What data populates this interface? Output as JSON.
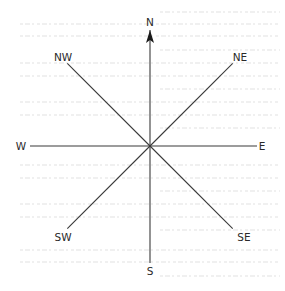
{
  "diagram": {
    "type": "compass-rose",
    "title": "",
    "directions": [
      {
        "id": "n",
        "label": "N",
        "bearing_deg": 0,
        "has_arrow": true
      },
      {
        "id": "ne",
        "label": "NE",
        "bearing_deg": 45,
        "has_arrow": false
      },
      {
        "id": "e",
        "label": "E",
        "bearing_deg": 90,
        "has_arrow": false
      },
      {
        "id": "se",
        "label": "SE",
        "bearing_deg": 135,
        "has_arrow": false
      },
      {
        "id": "s",
        "label": "S",
        "bearing_deg": 180,
        "has_arrow": false
      },
      {
        "id": "sw",
        "label": "SW",
        "bearing_deg": 225,
        "has_arrow": false
      },
      {
        "id": "w",
        "label": "W",
        "bearing_deg": 270,
        "has_arrow": false
      },
      {
        "id": "nw",
        "label": "NW",
        "bearing_deg": 315,
        "has_arrow": false
      }
    ],
    "colors": {
      "line": "#3a3a3a",
      "text": "#2a2a2a",
      "background": "#ffffff"
    }
  }
}
